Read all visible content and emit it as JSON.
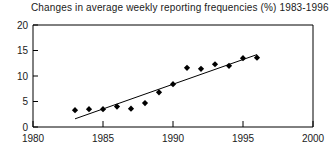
{
  "chart_data": {
    "type": "scatter",
    "title": "Changes in average weekly reporting frequencies (%) 1983-1996",
    "xlabel": "",
    "ylabel": "",
    "xlim": [
      1980,
      2000
    ],
    "ylim": [
      0,
      20
    ],
    "grid": false,
    "legend": null,
    "xticks": [
      1980,
      1985,
      1990,
      1995,
      2000
    ],
    "yticks": [
      0,
      5,
      10,
      15,
      20
    ],
    "x": [
      1983,
      1984,
      1985,
      1986,
      1987,
      1988,
      1989,
      1990,
      1991,
      1992,
      1993,
      1994,
      1995,
      1996
    ],
    "values": [
      3.3,
      3.5,
      3.5,
      4.0,
      3.6,
      4.7,
      6.8,
      8.4,
      11.6,
      11.4,
      12.3,
      12.0,
      13.5,
      13.6
    ],
    "series": [
      {
        "name": "Average weekly reporting frequency change",
        "marker": "diamond",
        "color": "#000000",
        "values": [
          3.3,
          3.5,
          3.5,
          4.0,
          3.6,
          4.7,
          6.8,
          8.4,
          11.6,
          11.4,
          12.3,
          12.0,
          13.5,
          13.6
        ]
      }
    ],
    "trendline": {
      "name": "linear-fit",
      "color": "#000000",
      "x_start": 1983,
      "y_start": 1.6,
      "x_end": 1996,
      "y_end": 14.2
    },
    "annotations": []
  },
  "axes": {
    "x_tick_labels": [
      "1980",
      "1985",
      "1990",
      "1995",
      "2000"
    ],
    "y_tick_labels": [
      "0",
      "5",
      "10",
      "15",
      "20"
    ]
  }
}
